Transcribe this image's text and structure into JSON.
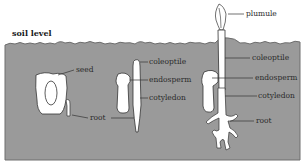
{
  "diagram": {
    "soil_label": "soil level",
    "colors": {
      "soil": "#9a9a9a",
      "soil_edge": "#6e6e6e",
      "seed_fill": "#ffffff",
      "outline": "#333333",
      "background": "#ffffff"
    },
    "stages": [
      {
        "name": "stage-1",
        "labels": [
          "seed",
          "root"
        ]
      },
      {
        "name": "stage-2",
        "labels": [
          "coleoptile",
          "endosperm",
          "cotyledon"
        ]
      },
      {
        "name": "stage-3",
        "labels": [
          "plumule",
          "coleoptile",
          "endosperm",
          "cotyledon",
          "root"
        ]
      }
    ]
  }
}
